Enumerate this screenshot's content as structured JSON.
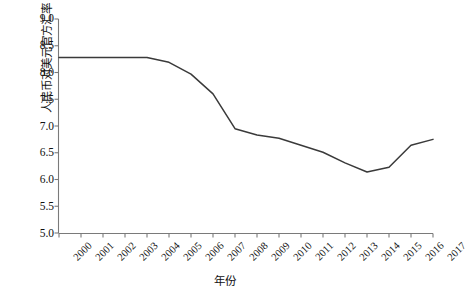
{
  "chart_data": {
    "type": "line",
    "title": "",
    "xlabel": "年份",
    "ylabel": "人民币对美元官方汇率",
    "categories": [
      "2000",
      "2001",
      "2002",
      "2003",
      "2004",
      "2005",
      "2006",
      "2007",
      "2008",
      "2009",
      "2010",
      "2011",
      "2012",
      "2013",
      "2014",
      "2015",
      "2016",
      "2017"
    ],
    "values": [
      8.28,
      8.28,
      8.28,
      8.28,
      8.28,
      8.19,
      7.97,
      7.6,
      6.95,
      6.83,
      6.77,
      6.64,
      6.51,
      6.31,
      6.14,
      6.23,
      6.64,
      6.75
    ],
    "series": [
      {
        "name": "人民币对美元官方汇率",
        "values": [
          8.28,
          8.28,
          8.28,
          8.28,
          8.28,
          8.19,
          7.97,
          7.6,
          6.95,
          6.83,
          6.77,
          6.64,
          6.51,
          6.31,
          6.14,
          6.23,
          6.64,
          6.75
        ]
      }
    ],
    "yticks": [
      5.0,
      5.5,
      6.0,
      6.5,
      7.0,
      7.5,
      8.0,
      8.5,
      9.0
    ],
    "ytick_labels": [
      "5.0",
      "5.5",
      "6.0",
      "6.5",
      "7.0",
      "7.5",
      "8.0",
      "8.5",
      "9.0"
    ],
    "ylim": [
      5.0,
      9.0
    ],
    "xlim": [
      "2000",
      "2017"
    ],
    "grid": false,
    "legend": "none",
    "line_color": "#3a3a3a",
    "axis_color": "#7a7a7a"
  }
}
